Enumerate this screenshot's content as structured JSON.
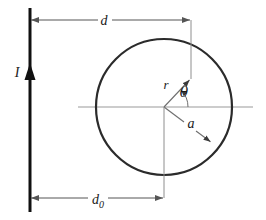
{
  "figure": {
    "type": "physics-diagram",
    "background_color": "#ffffff"
  },
  "labels": {
    "current": "I",
    "distance_top": "d",
    "distance_bottom": "d",
    "distance_bottom_sub": "0",
    "radius_vector": "r",
    "angle": "θ",
    "circle_radius": "a"
  },
  "colors": {
    "wire": "#111111",
    "circle": "#2b2b2b",
    "axis": "#9a9a9a",
    "dimension": "#555555",
    "vector": "#6e6e6e",
    "text": "#1a1a1a"
  },
  "geometry": {
    "wire": {
      "x": 30,
      "y_top": 8,
      "y_bottom": 212,
      "stroke_width": 3
    },
    "current_arrow_y": 72,
    "circle": {
      "cx": 164,
      "cy": 107,
      "r": 68,
      "stroke_width": 2
    },
    "axis_line": {
      "x1": 78,
      "x2": 253,
      "y": 107
    },
    "dim_top": {
      "y": 20,
      "x1": 30,
      "x2": 191,
      "label_x": 104
    },
    "dim_bottom": {
      "y": 198,
      "x1": 30,
      "x2": 164,
      "label_x": 98
    },
    "drop_line_top": {
      "x": 191,
      "y1": 20,
      "y2": 78
    },
    "drop_line_bottom": {
      "x": 164,
      "y1": 107,
      "y2": 198
    },
    "r_vector": {
      "x1": 164,
      "y1": 107,
      "x2": 191,
      "y2": 78
    },
    "a_vector": {
      "x1": 164,
      "y1": 107,
      "x2": 212,
      "y2": 143
    },
    "theta_arc_radius": 24
  },
  "label_positions": {
    "current": {
      "x": 17,
      "y": 77
    },
    "distance_top": {
      "x": 104,
      "y": 24
    },
    "distance_bottom": {
      "x": 95,
      "y": 203
    },
    "radius_vector": {
      "x": 166,
      "y": 88
    },
    "angle": {
      "x": 183,
      "y": 96
    },
    "circle_radius": {
      "x": 191,
      "y": 127
    }
  }
}
